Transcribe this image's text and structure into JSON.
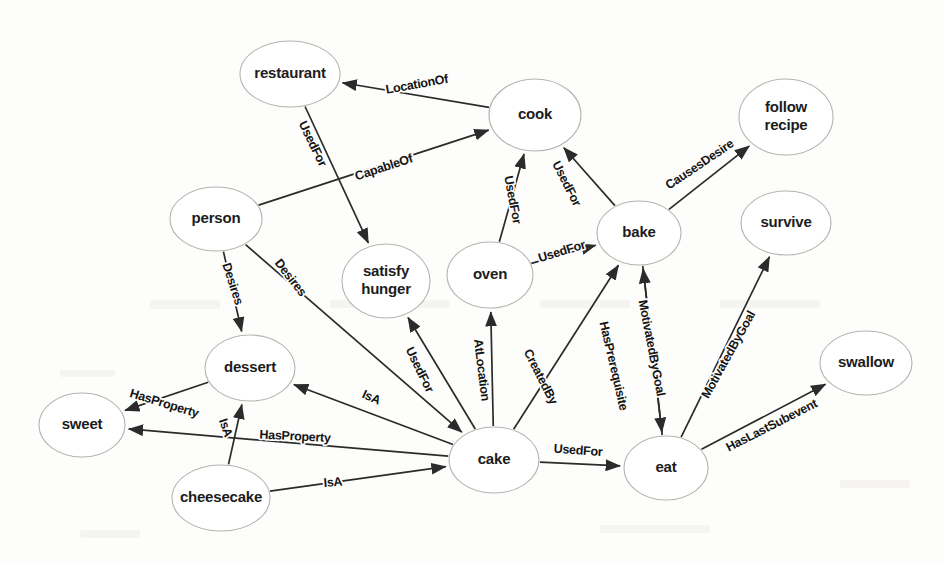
{
  "diagram": {
    "type": "directed-knowledge-graph",
    "node_count": 14,
    "edge_count": 22
  },
  "nodes": [
    {
      "id": "restaurant",
      "label": "restaurant",
      "cx": 290,
      "cy": 74,
      "rx": 50,
      "ry": 33,
      "lines": [
        "restaurant"
      ]
    },
    {
      "id": "cook",
      "label": "cook",
      "cx": 535,
      "cy": 115,
      "rx": 46,
      "ry": 36,
      "lines": [
        "cook"
      ]
    },
    {
      "id": "follow_recipe",
      "label": "follow recipe",
      "cx": 786,
      "cy": 117,
      "rx": 47,
      "ry": 38,
      "lines": [
        "follow",
        "recipe"
      ]
    },
    {
      "id": "person",
      "label": "person",
      "cx": 216,
      "cy": 219,
      "rx": 46,
      "ry": 32,
      "lines": [
        "person"
      ]
    },
    {
      "id": "bake",
      "label": "bake",
      "cx": 639,
      "cy": 233,
      "rx": 42,
      "ry": 32,
      "lines": [
        "bake"
      ]
    },
    {
      "id": "survive",
      "label": "survive",
      "cx": 786,
      "cy": 223,
      "rx": 45,
      "ry": 32,
      "lines": [
        "survive"
      ]
    },
    {
      "id": "satisfy_hunger",
      "label": "satisfy hunger",
      "cx": 386,
      "cy": 281,
      "rx": 44,
      "ry": 37,
      "lines": [
        "satisfy",
        "hunger"
      ]
    },
    {
      "id": "oven",
      "label": "oven",
      "cx": 490,
      "cy": 275,
      "rx": 43,
      "ry": 33,
      "lines": [
        "oven"
      ]
    },
    {
      "id": "dessert",
      "label": "dessert",
      "cx": 250,
      "cy": 368,
      "rx": 45,
      "ry": 33,
      "lines": [
        "dessert"
      ]
    },
    {
      "id": "swallow",
      "label": "swallow",
      "cx": 866,
      "cy": 363,
      "rx": 46,
      "ry": 32,
      "lines": [
        "swallow"
      ]
    },
    {
      "id": "sweet",
      "label": "sweet",
      "cx": 82,
      "cy": 425,
      "rx": 43,
      "ry": 32,
      "lines": [
        "sweet"
      ]
    },
    {
      "id": "cake",
      "label": "cake",
      "cx": 494,
      "cy": 460,
      "rx": 45,
      "ry": 33,
      "lines": [
        "cake"
      ]
    },
    {
      "id": "eat",
      "label": "eat",
      "cx": 666,
      "cy": 468,
      "rx": 42,
      "ry": 32,
      "lines": [
        "eat"
      ]
    },
    {
      "id": "cheesecake",
      "label": "cheesecake",
      "cx": 221,
      "cy": 498,
      "rx": 49,
      "ry": 33,
      "lines": [
        "cheesecake"
      ]
    }
  ],
  "edges": [
    {
      "from": "cook",
      "to": "restaurant",
      "relation": "LocationOf",
      "lx": 417,
      "ly": 85,
      "rot": -10
    },
    {
      "from": "restaurant",
      "to": "satisfy_hunger",
      "relation": "UsedFor",
      "lx": 312,
      "ly": 144,
      "rot": 64
    },
    {
      "from": "person",
      "to": "cook",
      "relation": "CapableOf",
      "lx": 384,
      "ly": 168,
      "rot": -18
    },
    {
      "from": "person",
      "to": "dessert",
      "relation": "Desires",
      "lx": 232,
      "ly": 284,
      "rot": 72
    },
    {
      "from": "person",
      "to": "cake",
      "relation": "Desires",
      "lx": 290,
      "ly": 278,
      "rot": 52
    },
    {
      "from": "bake",
      "to": "follow_recipe",
      "relation": "CausesDesire",
      "lx": 700,
      "ly": 165,
      "rot": -34
    },
    {
      "from": "oven",
      "to": "cook",
      "relation": "UsedFor",
      "lx": 512,
      "ly": 200,
      "rot": 79
    },
    {
      "from": "oven",
      "to": "bake",
      "relation": "UsedFor",
      "lx": 562,
      "ly": 252,
      "rot": -17
    },
    {
      "from": "bake",
      "to": "cook",
      "relation": "UsedFor",
      "lx": 566,
      "ly": 184,
      "rot": 63
    },
    {
      "from": "cake",
      "to": "satisfy_hunger",
      "relation": "UsedFor",
      "lx": 419,
      "ly": 370,
      "rot": 64
    },
    {
      "from": "cake",
      "to": "oven",
      "relation": "AtLocation",
      "lx": 481,
      "ly": 370,
      "rot": 83
    },
    {
      "from": "cake",
      "to": "bake",
      "relation": "CreatedBy",
      "lx": 540,
      "ly": 377,
      "rot": 63
    },
    {
      "from": "cake",
      "to": "eat",
      "relation": "UsedFor",
      "lx": 578,
      "ly": 451,
      "rot": 4
    },
    {
      "from": "cake",
      "to": "dessert",
      "relation": "IsA",
      "lx": 371,
      "ly": 398,
      "rot": 24
    },
    {
      "from": "cake",
      "to": "sweet",
      "relation": "HasProperty",
      "lx": 295,
      "ly": 437,
      "rot": 3
    },
    {
      "from": "dessert",
      "to": "sweet",
      "relation": "HasProperty",
      "lx": 164,
      "ly": 404,
      "rot": 17
    },
    {
      "from": "cheesecake",
      "to": "dessert",
      "relation": "IsA",
      "lx": 225,
      "ly": 428,
      "rot": 71
    },
    {
      "from": "cheesecake",
      "to": "cake",
      "relation": "IsA",
      "lx": 333,
      "ly": 483,
      "rot": -5
    },
    {
      "from": "eat",
      "to": "bake",
      "relation": "HasPrerequisite",
      "lx": 613,
      "ly": 366,
      "rot": 77
    },
    {
      "from": "bake",
      "to": "eat",
      "relation": "MotivatedByGoal",
      "lx": 651,
      "ly": 348,
      "rot": 79
    },
    {
      "from": "eat",
      "to": "survive",
      "relation": "MotivatedByGoal",
      "lx": 729,
      "ly": 355,
      "rot": -61
    },
    {
      "from": "eat",
      "to": "swallow",
      "relation": "HasLastSubevent",
      "lx": 772,
      "ly": 426,
      "rot": -27
    }
  ]
}
